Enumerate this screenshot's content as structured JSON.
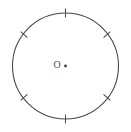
{
  "figure": {
    "type": "geometry-diagram",
    "width": 131,
    "height": 132,
    "background_color": "#ffffff",
    "stroke_color": "#454545",
    "label_color": "#4f4f4f"
  },
  "circle": {
    "center_x": 65.5,
    "center_y": 66,
    "radius": 53,
    "stroke_color": "#454545",
    "stroke_width": 1.05,
    "fill": "none"
  },
  "center_point": {
    "label": "O",
    "label_x": 57,
    "label_y": 66,
    "dot_x": 65.5,
    "dot_y": 66,
    "dot_radius": 1.4,
    "dot_color": "#3c3c3c"
  },
  "tick_marks": [
    {
      "name": "tick-top",
      "angle_deg": 90,
      "length": 9,
      "x1": 65.5,
      "y1": 8.5,
      "x2": 65.5,
      "y2": 17.5
    },
    {
      "name": "tick-upper-right",
      "angle_deg": 38,
      "length": 9,
      "x1": 110.3,
      "y1": 31.6,
      "x2": 103.6,
      "y2": 37.6
    },
    {
      "name": "tick-lower-right",
      "angle_deg": -38,
      "length": 9,
      "x1": 110.3,
      "y1": 100.4,
      "x2": 103.6,
      "y2": 94.4
    },
    {
      "name": "tick-bottom",
      "angle_deg": -90,
      "length": 9,
      "x1": 65.5,
      "y1": 123.5,
      "x2": 65.5,
      "y2": 114.5
    },
    {
      "name": "tick-lower-left",
      "angle_deg": -142,
      "length": 9,
      "x1": 20.7,
      "y1": 100.4,
      "x2": 27.4,
      "y2": 94.4
    },
    {
      "name": "tick-upper-left",
      "angle_deg": 142,
      "length": 9,
      "x1": 20.7,
      "y1": 31.6,
      "x2": 27.4,
      "y2": 37.6
    }
  ]
}
